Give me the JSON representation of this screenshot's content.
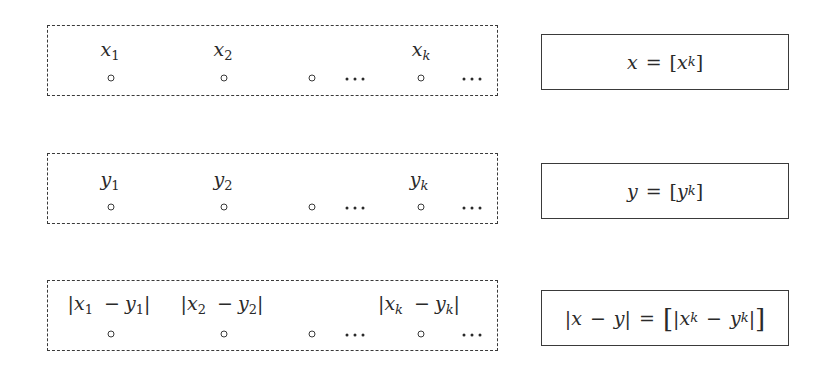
{
  "rows": [
    {
      "id": "x",
      "elements": [
        {
          "var": "x",
          "sub": "1"
        },
        {
          "var": "x",
          "sub": "2"
        },
        {
          "var": "x",
          "sub": "k"
        }
      ],
      "ellipsis": "···",
      "definition": {
        "lhs": "x",
        "eq": "=",
        "open": "[",
        "inner_var": "x",
        "inner_sub": "k",
        "close": "]"
      }
    },
    {
      "id": "y",
      "elements": [
        {
          "var": "y",
          "sub": "1"
        },
        {
          "var": "y",
          "sub": "2"
        },
        {
          "var": "y",
          "sub": "k"
        }
      ],
      "ellipsis": "···",
      "definition": {
        "lhs": "y",
        "eq": "=",
        "open": "[",
        "inner_var": "y",
        "inner_sub": "k",
        "close": "]"
      }
    },
    {
      "id": "abs-diff",
      "elements": [
        {
          "a": "x",
          "a_sub": "1",
          "minus": "−",
          "b": "y",
          "b_sub": "1"
        },
        {
          "a": "x",
          "a_sub": "2",
          "minus": "−",
          "b": "y",
          "b_sub": "2"
        },
        {
          "a": "x",
          "a_sub": "k",
          "minus": "−",
          "b": "y",
          "b_sub": "k"
        }
      ],
      "ellipsis": "···",
      "definition": {
        "bar": "|",
        "lhs_a": "x",
        "minus": "−",
        "lhs_b": "y",
        "eq": "=",
        "open": "[",
        "close": "]",
        "inner_a": "x",
        "inner_a_sub": "k",
        "inner_b": "y",
        "inner_b_sub": "k"
      }
    }
  ],
  "colors": {
    "stroke": "#3a3a3a",
    "text": "#2a2a2a",
    "background": "#ffffff"
  }
}
